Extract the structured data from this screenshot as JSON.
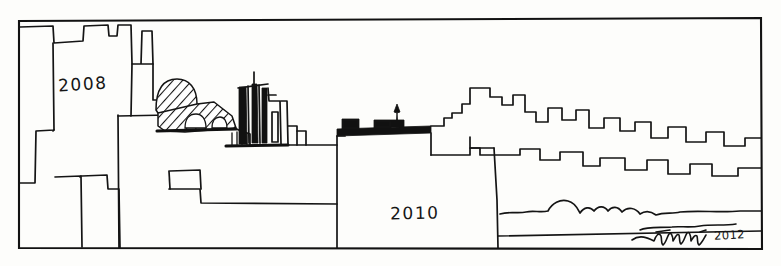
{
  "artwork": {
    "medium": "pen-and-ink line drawing",
    "subject": "city skyline",
    "ink_color": "#141414",
    "paper_color": "#fdfdfb",
    "width": 781,
    "height": 266
  },
  "frame": {
    "name": "rectangular-border",
    "left": 18,
    "top": 19,
    "right": 762,
    "bottom": 249
  },
  "labels": {
    "year_left": "2008",
    "year_right": "2010"
  },
  "signature": {
    "name": "Tinarelli",
    "year": "2012"
  },
  "elements": [
    {
      "name": "left-skyline-block",
      "label": "2008"
    },
    {
      "name": "hatched-dome"
    },
    {
      "name": "hatched-bridge"
    },
    {
      "name": "dark-towers"
    },
    {
      "name": "black-rooftop-band"
    },
    {
      "name": "water-tower-spire"
    },
    {
      "name": "right-stepped-skyline"
    },
    {
      "name": "center-skyline-block",
      "label": "2010"
    },
    {
      "name": "foliage-line"
    }
  ]
}
